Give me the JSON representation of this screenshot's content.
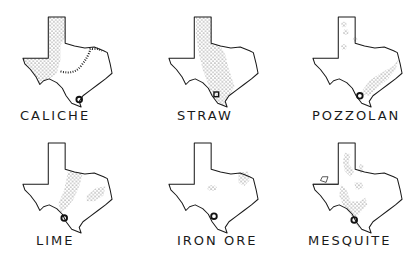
{
  "diagram": {
    "type": "small-multiples-maps",
    "region": "Texas",
    "ink_color": "#1a1a1a",
    "background": "#ffffff",
    "panels": [
      {
        "label": "CALICHE",
        "distribution": "west and panhandle, central band, gulf coast spots"
      },
      {
        "label": "STRAW",
        "distribution": "central north-south band from panhandle to south"
      },
      {
        "label": "POZZOLAN",
        "distribution": "scattered north, coastal band southeast"
      },
      {
        "label": "LIME",
        "distribution": "central band and east"
      },
      {
        "label": "IRON ORE",
        "distribution": "small central spot and northeast"
      },
      {
        "label": "MESQUITE",
        "distribution": "scattered central and south texas"
      }
    ]
  }
}
